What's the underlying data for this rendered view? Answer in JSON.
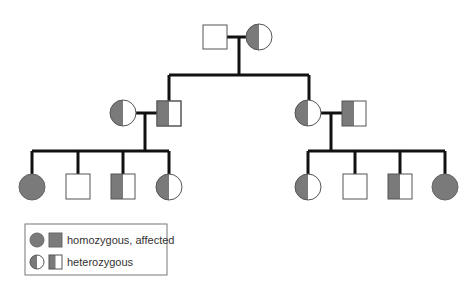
{
  "colors": {
    "affected_fill": "#7a7a7a",
    "line": "#111111",
    "outline": "#555555",
    "background": "#ffffff"
  },
  "generations": [
    {
      "label": "I",
      "individuals": [
        {
          "id": "I-1",
          "sex": "male",
          "status": "unaffected"
        },
        {
          "id": "I-2",
          "sex": "female",
          "status": "heterozygous"
        }
      ]
    },
    {
      "label": "II",
      "individuals": [
        {
          "id": "II-1",
          "sex": "female",
          "status": "heterozygous",
          "note": "spouse"
        },
        {
          "id": "II-2",
          "sex": "male",
          "status": "heterozygous",
          "note": "child of I-1 x I-2"
        },
        {
          "id": "II-3",
          "sex": "female",
          "status": "heterozygous",
          "note": "child of I-1 x I-2"
        },
        {
          "id": "II-4",
          "sex": "male",
          "status": "heterozygous",
          "note": "spouse"
        }
      ]
    },
    {
      "label": "III",
      "individuals": [
        {
          "id": "III-1",
          "sex": "female",
          "status": "homozygous_affected"
        },
        {
          "id": "III-2",
          "sex": "male",
          "status": "unaffected"
        },
        {
          "id": "III-3",
          "sex": "male",
          "status": "heterozygous"
        },
        {
          "id": "III-4",
          "sex": "female",
          "status": "heterozygous"
        },
        {
          "id": "III-5",
          "sex": "female",
          "status": "heterozygous"
        },
        {
          "id": "III-6",
          "sex": "male",
          "status": "unaffected"
        },
        {
          "id": "III-7",
          "sex": "male",
          "status": "heterozygous"
        },
        {
          "id": "III-8",
          "sex": "female",
          "status": "homozygous_affected"
        }
      ]
    }
  ],
  "legend": {
    "items": [
      {
        "symbol": "filled circle and square",
        "label": "homozygous, affected"
      },
      {
        "symbol": "half-filled circle and square",
        "label": "heterozygous"
      }
    ]
  }
}
